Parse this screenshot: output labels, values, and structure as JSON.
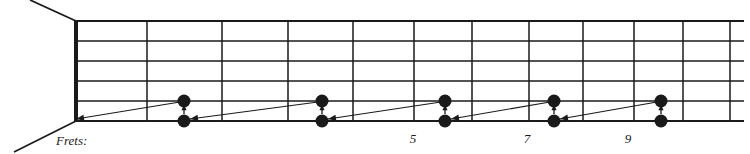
{
  "figure": {
    "caption_label": "Frets:",
    "ink_color": "#1a1a1a",
    "background_color": "#ffffff"
  },
  "fretboard": {
    "string_count": 6,
    "nut_x": 76,
    "board_top_y": 21,
    "board_bottom_y": 121,
    "string_spacing": 20,
    "string_y": [
      21,
      41,
      61,
      81,
      101,
      121
    ],
    "fret_line_x": [
      147,
      222,
      288,
      353,
      414,
      472,
      529,
      583,
      634,
      683,
      730
    ],
    "right_edge_x": 744,
    "perspective_lines": [
      {
        "name": "upper-body-edge",
        "x1": 76,
        "y1": 21,
        "x2": 30,
        "y2": 0
      },
      {
        "name": "lower-body-edge",
        "x1": 76,
        "y1": 121,
        "x2": 14,
        "y2": 152
      }
    ]
  },
  "fret_markers": {
    "numbers": [
      {
        "label": "5",
        "x": 413,
        "y": 143
      },
      {
        "label": "7",
        "x": 527,
        "y": 143
      },
      {
        "label": "9",
        "x": 628,
        "y": 143
      }
    ]
  },
  "caption": {
    "text": "Frets:",
    "x": 56,
    "y": 145
  },
  "notes": [
    {
      "name": "note-pair-1-high",
      "x": 184,
      "y": 101,
      "string": 5
    },
    {
      "name": "note-pair-1-low",
      "x": 184,
      "y": 121,
      "string": 6
    },
    {
      "name": "note-pair-2-high",
      "x": 322,
      "y": 101,
      "string": 5
    },
    {
      "name": "note-pair-2-low",
      "x": 322,
      "y": 121,
      "string": 6
    },
    {
      "name": "note-pair-3-high",
      "x": 445,
      "y": 101,
      "string": 5
    },
    {
      "name": "note-pair-3-low",
      "x": 445,
      "y": 121,
      "string": 6
    },
    {
      "name": "note-pair-4-high",
      "x": 554,
      "y": 101,
      "string": 5
    },
    {
      "name": "note-pair-4-low",
      "x": 554,
      "y": 121,
      "string": 6
    },
    {
      "name": "note-pair-5-high",
      "x": 661,
      "y": 101,
      "string": 5
    },
    {
      "name": "note-pair-5-low",
      "x": 661,
      "y": 121,
      "string": 6
    }
  ],
  "note_radius": 6.5,
  "slide_arrows": [
    {
      "name": "slide-arrow-1",
      "x1": 318,
      "y1": 102,
      "x2": 190,
      "y2": 119
    },
    {
      "name": "slide-arrow-2",
      "x1": 441,
      "y1": 102,
      "x2": 328,
      "y2": 119
    },
    {
      "name": "slide-arrow-3",
      "x1": 550,
      "y1": 102,
      "x2": 451,
      "y2": 119
    },
    {
      "name": "slide-arrow-4",
      "x1": 657,
      "y1": 102,
      "x2": 560,
      "y2": 119
    },
    {
      "name": "slide-arrow-5",
      "x1": 180,
      "y1": 102,
      "x2": 76,
      "y2": 119
    }
  ],
  "bend_arrows": [
    {
      "name": "bend-arrow-1",
      "x": 184,
      "y_from": 114,
      "y_to": 108
    },
    {
      "name": "bend-arrow-2",
      "x": 322,
      "y_from": 114,
      "y_to": 108
    },
    {
      "name": "bend-arrow-3",
      "x": 445,
      "y_from": 114,
      "y_to": 108
    },
    {
      "name": "bend-arrow-4",
      "x": 554,
      "y_from": 114,
      "y_to": 108
    },
    {
      "name": "bend-arrow-5",
      "x": 661,
      "y_from": 114,
      "y_to": 108
    }
  ]
}
